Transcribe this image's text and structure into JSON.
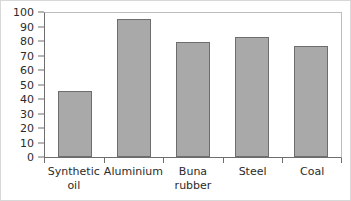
{
  "chart_data": {
    "type": "bar",
    "title": "",
    "subtitle": "",
    "xlabel": "",
    "ylabel": "",
    "categories": [
      "Synthetic\noil",
      "Aluminium",
      "Buna\nrubber",
      "Steel",
      "Coal"
    ],
    "values": [
      46,
      96,
      80,
      83,
      77
    ],
    "series": [
      {
        "name": "",
        "values": [
          46,
          96,
          80,
          83,
          77
        ]
      }
    ],
    "ylim": [
      0,
      100
    ],
    "ytick_labels": [
      "100",
      "90",
      "80",
      "70",
      "60",
      "50",
      "40",
      "30",
      "20",
      "10",
      "0"
    ],
    "ytick_values": [
      100,
      90,
      80,
      70,
      60,
      50,
      40,
      30,
      20,
      10,
      0
    ],
    "ytick_step": 10,
    "grid": false,
    "legend": false,
    "legend_position": "none",
    "bar_fill_color": "#a9a9a9",
    "bar_border_color": "#6d6d6d",
    "axis_color": "#6e6e6e",
    "plot_background": "#ffffff",
    "figure_background": "#ffffff",
    "text_color": "#2b2b2b"
  }
}
